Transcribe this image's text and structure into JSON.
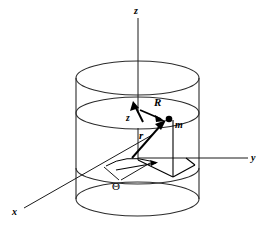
{
  "figure": {
    "background_color": "#ffffff",
    "line_color": "#1a1a1a",
    "cylinder_color": "#2b2b2b",
    "vector_color": "#000000"
  },
  "axes": {
    "z": {
      "label": "z",
      "direction": "up",
      "tip": [
        138,
        18
      ]
    },
    "y": {
      "label": "y",
      "direction": "right",
      "tip": [
        252,
        158
      ]
    },
    "x": {
      "label": "x",
      "direction": "lower-left",
      "tip": [
        18,
        210
      ]
    }
  },
  "vectors": {
    "R": {
      "label": "R",
      "description": "radial vector in plane from axis to point m"
    },
    "r": {
      "label": "r",
      "description": "position vector from origin to point m"
    },
    "z_height": {
      "label": "z",
      "description": "height of point m above xy-plane"
    }
  },
  "point": {
    "label": "m",
    "description": "point mass on cylinder surface"
  },
  "angle": {
    "label": "Θ",
    "description": "azimuthal angle measured from x-axis in the xy-plane"
  },
  "cylinder": {
    "top_ellipse_label": "cylinder-top-rim",
    "mid_ellipse_label": "cylinder-mid-ring",
    "bottom_ellipse_label": "cylinder-bottom-rim",
    "left_wall_label": "cylinder-left-wall",
    "right_wall_label": "cylinder-right-wall"
  }
}
